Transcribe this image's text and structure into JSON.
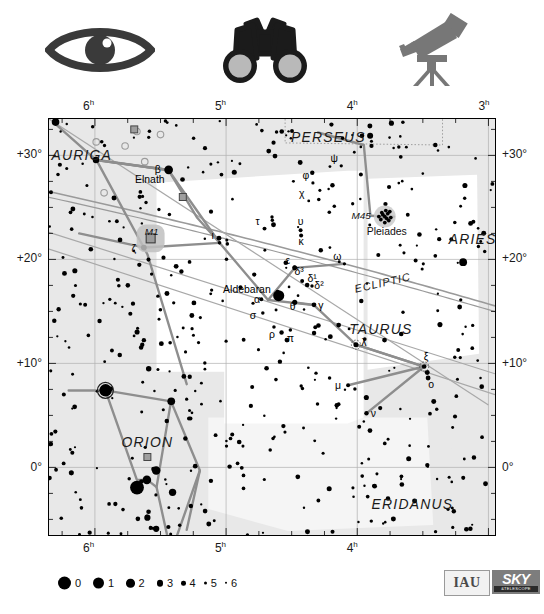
{
  "icons": [
    {
      "name": "eye-icon",
      "label": "naked-eye visibility"
    },
    {
      "name": "binoculars-icon",
      "label": "binocular visibility"
    },
    {
      "name": "telescope-icon",
      "label": "telescope visibility"
    }
  ],
  "chart_data": {
    "type": "scatter",
    "xlabel": "Right Ascension",
    "ylabel": "Declination",
    "xlim": [
      6.35,
      2.95
    ],
    "ylim": [
      -6.5,
      33.5
    ],
    "grid": true,
    "legend_position": "bottom-left",
    "ra_ticks_top": [
      "6h",
      "5h",
      "4h",
      "3h"
    ],
    "ra_ticks_bottom": [
      "6h",
      "5h",
      "4h"
    ],
    "ra_tick_values_top": [
      6,
      5,
      4,
      3
    ],
    "ra_tick_values_bottom": [
      6,
      5,
      4
    ],
    "dec_ticks_left": [
      "+30°",
      "+20°",
      "+10°",
      "0°"
    ],
    "dec_ticks_right": [
      "+30°",
      "+20°",
      "+10°",
      "0°"
    ],
    "dec_tick_values": [
      30,
      20,
      10,
      0
    ],
    "magnitude_legend": {
      "title": "",
      "entries": [
        {
          "label": "0",
          "size": 13
        },
        {
          "label": "1",
          "size": 11
        },
        {
          "label": "2",
          "size": 8.5
        },
        {
          "label": "3",
          "size": 6.5
        },
        {
          "label": "4",
          "size": 4.5
        },
        {
          "label": "5",
          "size": 3.2
        },
        {
          "label": "6",
          "size": 2.4
        }
      ]
    },
    "constellations": [
      {
        "name": "AURIGA",
        "ra": 6.1,
        "dec": 29.6
      },
      {
        "name": "PERSEUS",
        "ra": 4.22,
        "dec": 31.3
      },
      {
        "name": "ARIES",
        "ra": 3.12,
        "dec": 21.5
      },
      {
        "name": "TAURUS",
        "ra": 3.82,
        "dec": 12.8
      },
      {
        "name": "ORION",
        "ra": 5.6,
        "dec": 2.0
      },
      {
        "name": "ERIDANUS",
        "ra": 3.58,
        "dec": -4.0
      }
    ],
    "ecliptic_label": {
      "text": "ECLIPTIC",
      "ra": 3.8,
      "dec": 17.4,
      "rotate": -13
    },
    "named_stars": [
      {
        "name": "Elnath",
        "bayer": "β",
        "ra": 5.438,
        "dec": 28.61,
        "mag": 1.65
      },
      {
        "name": "Aldebaran",
        "bayer": "α",
        "ra": 4.599,
        "dec": 16.51,
        "mag": 0.85
      }
    ],
    "deep_sky": [
      {
        "name": "M1",
        "ra": 5.575,
        "dec": 22.02,
        "type": "nebula"
      },
      {
        "name": "M45",
        "alt": "Pleiades",
        "ra": 3.79,
        "dec": 24.12,
        "type": "open-cluster"
      }
    ],
    "bayer_labels": [
      {
        "g": "β",
        "ra": 5.438,
        "dec": 28.61
      },
      {
        "g": "ζ",
        "ra": 5.627,
        "dec": 21.14
      },
      {
        "g": "ι",
        "ra": 5.05,
        "dec": 21.59
      },
      {
        "g": "ψ",
        "ra": 4.122,
        "dec": 29.0
      },
      {
        "g": "φ",
        "ra": 4.338,
        "dec": 27.35
      },
      {
        "g": "χ",
        "ra": 4.37,
        "dec": 25.62
      },
      {
        "g": "τ",
        "ra": 4.707,
        "dec": 22.96
      },
      {
        "g": "υ",
        "ra": 4.432,
        "dec": 22.81
      },
      {
        "g": "κ",
        "ra": 4.428,
        "dec": 22.29
      },
      {
        "g": "ε",
        "ra": 4.477,
        "dec": 19.18
      },
      {
        "g": "ω",
        "ra": 4.098,
        "dec": 19.57
      },
      {
        "g": "δ³",
        "ra": 4.42,
        "dec": 17.93
      },
      {
        "g": "δ¹",
        "ra": 4.382,
        "dec": 17.54
      },
      {
        "g": "δ²",
        "ra": 4.345,
        "dec": 17.44
      },
      {
        "g": "θ",
        "ra": 4.477,
        "dec": 15.87
      },
      {
        "g": "γ",
        "ra": 4.33,
        "dec": 15.63
      },
      {
        "g": "α",
        "ra": 4.68,
        "dec": 16.1
      },
      {
        "g": "σ",
        "ra": 4.72,
        "dec": 14.85
      },
      {
        "g": "ρ",
        "ra": 4.635,
        "dec": 13.5
      },
      {
        "g": "π",
        "ra": 4.51,
        "dec": 13.22
      },
      {
        "g": "λ",
        "ra": 4.01,
        "dec": 11.8
      },
      {
        "g": "ξ",
        "ra": 3.49,
        "dec": 9.7
      },
      {
        "g": "ο",
        "ra": 3.46,
        "dec": 8.6
      },
      {
        "g": "μ",
        "ra": 4.07,
        "dec": 7.9
      },
      {
        "g": "ν",
        "ra": 3.93,
        "dec": 5.2
      }
    ]
  }
}
